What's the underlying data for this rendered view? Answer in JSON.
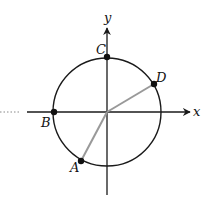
{
  "diagram": {
    "type": "unit-circle",
    "axes": {
      "x_label": "x",
      "y_label": "y"
    },
    "center": {
      "x": 107,
      "y": 112
    },
    "radius": 54,
    "colors": {
      "axis": "#1a1a1a",
      "circle": "#1a1a1a",
      "radius_line": "#999999",
      "point": "#111111",
      "dotted": "#888888"
    },
    "points": [
      {
        "label": "A",
        "x": 81,
        "y": 161,
        "connected_to_origin": true
      },
      {
        "label": "B",
        "x": 54,
        "y": 112,
        "connected_to_origin": false
      },
      {
        "label": "C",
        "x": 107,
        "y": 57,
        "connected_to_origin": false
      },
      {
        "label": "D",
        "x": 154,
        "y": 84,
        "connected_to_origin": true
      }
    ]
  }
}
